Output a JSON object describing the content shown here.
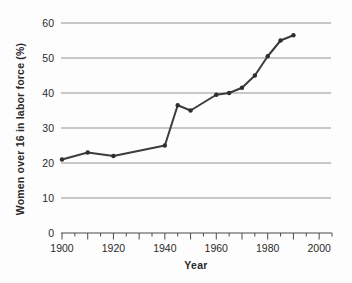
{
  "chart_data": {
    "type": "line",
    "title": "",
    "xlabel": "Year",
    "ylabel": "Women over 16 in labor force (%)",
    "series": [
      {
        "name": "women-labor-force-percent",
        "x": [
          1900,
          1910,
          1920,
          1940,
          1945,
          1950,
          1960,
          1965,
          1970,
          1975,
          1980,
          1985,
          1990
        ],
        "values": [
          21,
          23,
          22,
          25,
          36.5,
          35,
          39.5,
          40,
          41.5,
          45,
          50.5,
          55,
          56.5
        ]
      }
    ],
    "xlim": [
      1900,
      2005
    ],
    "ylim": [
      0,
      60
    ],
    "yticks": [
      0,
      10,
      20,
      30,
      40,
      50,
      60
    ],
    "xticks_labeled": [
      1900,
      1920,
      1940,
      1960,
      1980,
      2000
    ],
    "xtick_minor_step": 5,
    "grid": "horizontal",
    "legend": "none",
    "colors": {
      "line": "#3c3c3c",
      "marker": "#2e2e2e",
      "gridline": "#949494",
      "axis": "#4a4a4a",
      "text": "#2a2a2a",
      "background": "#fdfdfd"
    }
  }
}
